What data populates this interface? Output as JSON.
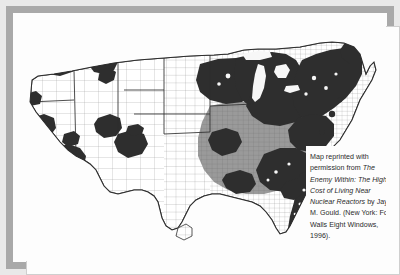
{
  "figure": {
    "kind": "map-figure",
    "frame_outer_color": "#e9e9e9",
    "frame_border_color": "#a9a9a9",
    "plate_color": "#fdfdfd"
  },
  "map": {
    "name": "united-states-county-choropleth",
    "subject": "Counties near nuclear reactors / cancer mortality",
    "projection": "albers-usa",
    "colors": {
      "dark_fill": "#2e2e2e",
      "mid_fill": "#9a9a9a",
      "light_fill": "#ffffff",
      "county_line": "#8d8d8d",
      "state_line": "#2e2e2e",
      "coastline": "#2e2e2e",
      "lake_fill": "#f7f7f7"
    },
    "legend_classes": [
      {
        "label": "high",
        "color": "#2e2e2e"
      },
      {
        "label": "medium",
        "color": "#9a9a9a"
      },
      {
        "label": "low",
        "color": "#ffffff"
      }
    ]
  },
  "caption": {
    "line_1": "Map reprinted with",
    "line_2_prefix": "permission from ",
    "title_part_1": "The",
    "title_part_2": "Enemy Within: The",
    "title_part_3": "High Cost of Living",
    "title_part_4": "Near Nuclear",
    "title_part_5": "Reactors",
    "author_and_pub": " by Jay M. Gould. (New York: Four Walls Eight Windows, 1996).",
    "full_text": "Map reprinted with permission from The Enemy Within: The High Cost of Living Near Nuclear Reactors by Jay M. Gould. (New York: Four Walls Eight Windows, 1996)."
  }
}
